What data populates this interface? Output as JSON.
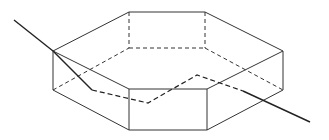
{
  "diagram": {
    "title": "",
    "colors": {
      "background": "#ffffff",
      "stroke": "#333333",
      "ray": "#222222"
    },
    "prism": {
      "visible_edges": [
        [
          53,
          51,
          129,
          12
        ],
        [
          129,
          12,
          205,
          12
        ],
        [
          205,
          12,
          283,
          51
        ],
        [
          283,
          51,
          207,
          89
        ],
        [
          207,
          89,
          129,
          89
        ],
        [
          129,
          89,
          53,
          51
        ],
        [
          53,
          51,
          53,
          90
        ],
        [
          129,
          89,
          129,
          130
        ],
        [
          207,
          89,
          207,
          130
        ],
        [
          283,
          51,
          283,
          90
        ],
        [
          53,
          90,
          129,
          130
        ],
        [
          129,
          130,
          207,
          130
        ],
        [
          207,
          130,
          283,
          90
        ]
      ],
      "hidden_edges": [
        [
          129,
          12,
          129,
          48
        ],
        [
          205,
          12,
          205,
          48
        ],
        [
          53,
          90,
          129,
          48
        ],
        [
          129,
          48,
          205,
          48
        ],
        [
          205,
          48,
          283,
          90
        ]
      ]
    },
    "ray": {
      "visible_segments": [
        [
          14,
          20,
          53,
          51
        ],
        [
          53,
          51,
          92,
          90
        ],
        [
          243,
          91,
          310,
          122
        ]
      ],
      "hidden_path": [
        [
          92,
          90
        ],
        [
          148,
          103
        ],
        [
          197,
          75
        ],
        [
          243,
          91
        ]
      ]
    }
  }
}
